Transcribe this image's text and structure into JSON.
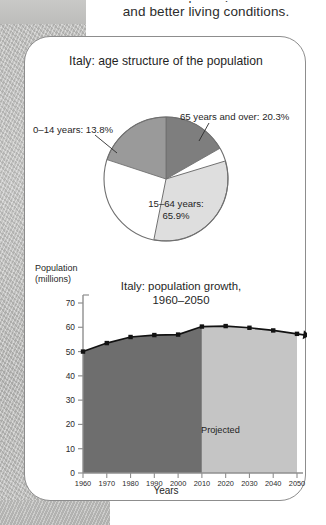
{
  "intro": {
    "clipped_line": "…and growing…",
    "line": "and better living conditions."
  },
  "pie": {
    "title": "Italy: age structure of the population",
    "callout_young": "0–14 years: 13.8%",
    "callout_old": "65 years and over: 20.3%",
    "center_label_line1": "15–64 years:",
    "center_label_line2": "65.9%"
  },
  "line_chart": {
    "axis_caption_line1": "Population",
    "axis_caption_line2": "(millions)",
    "title_line1": "Italy: population growth,",
    "title_line2": "1960–2050",
    "projected_label": "Projected",
    "xaxis_caption": "Years"
  },
  "colors": {
    "card_border": "#8d8d8d",
    "pie_young": "#9a9a9a",
    "pie_old": "#7e7e7e",
    "pie_working": "#dedede",
    "area_historical": "#6e6e6e",
    "area_projected": "#c5c5c5",
    "line": "#121212",
    "axis": "#8f8f8f",
    "page_margin": "#bdbdbb"
  },
  "chart_data": [
    {
      "type": "pie",
      "title": "Italy: age structure of the population",
      "categories": [
        "0–14 years",
        "15–64 years",
        "65 years and over"
      ],
      "values": [
        13.8,
        65.9,
        20.3
      ],
      "unit": "percent",
      "labels": [
        "0–14 years: 13.8%",
        "15–64 years: 65.9%",
        "65 years and over: 20.3%"
      ],
      "slice_colors": [
        "#9a9a9a",
        "#dedede",
        "#7e7e7e"
      ],
      "start_angle_deg": 0,
      "direction": "clockwise",
      "legend": "none (direct labels with leader lines)"
    },
    {
      "type": "area",
      "title": "Italy: population growth, 1960–2050",
      "xlabel": "Years",
      "ylabel": "Population (millions)",
      "x": [
        1960,
        1970,
        1980,
        1990,
        2000,
        2010,
        2020,
        2030,
        2040,
        2050
      ],
      "values": [
        50.0,
        53.5,
        56.0,
        56.8,
        57.0,
        60.3,
        60.5,
        59.8,
        58.7,
        57.3
      ],
      "xlim": [
        1960,
        2050
      ],
      "ylim": [
        0,
        70
      ],
      "ytick_values": [
        0,
        10,
        20,
        30,
        40,
        50,
        60,
        70
      ],
      "ytick_labels": [
        "0",
        "10",
        "20",
        "30",
        "40",
        "50",
        "60",
        "70"
      ],
      "xtick_labels": [
        "1960",
        "1970",
        "1980",
        "1990",
        "2000",
        "2010",
        "2020",
        "2030",
        "2040",
        "2050"
      ],
      "grid": false,
      "legend": "none",
      "annotations": [
        {
          "text": "Projected",
          "x_range": [
            2010,
            2050
          ],
          "note": "lighter shaded band covering projected years"
        }
      ],
      "regions": [
        {
          "name": "historical",
          "x_range": [
            1960,
            2010
          ],
          "fill": "#6e6e6e"
        },
        {
          "name": "projected",
          "x_range": [
            2010,
            2050
          ],
          "fill": "#c5c5c5"
        }
      ],
      "markers": true,
      "marker_shape": "square",
      "line_end_arrow": true
    }
  ]
}
